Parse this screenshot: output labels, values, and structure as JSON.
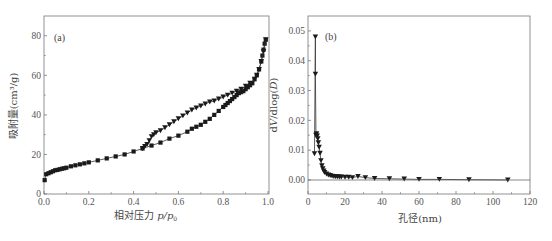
{
  "chart_data": [
    {
      "type": "scatter",
      "panel_label": "(a)",
      "title": "",
      "xlabel": "相对压力 p/p0",
      "xlabel_main": "相对压力 ",
      "xlabel_var": "p/p",
      "xlabel_sub": "0",
      "ylabel": "吸附量(cm³/g)",
      "xlim": [
        0.0,
        1.0
      ],
      "ylim": [
        0,
        90
      ],
      "xticks": [
        "0.0",
        "0.2",
        "0.4",
        "0.6",
        "0.8",
        "1.0"
      ],
      "yticks": [
        "0",
        "20",
        "40",
        "60",
        "80"
      ],
      "grid": false,
      "legend": "none",
      "series": [
        {
          "name": "adsorption",
          "marker": "square",
          "x": [
            0.003,
            0.01,
            0.02,
            0.03,
            0.04,
            0.05,
            0.06,
            0.07,
            0.08,
            0.09,
            0.1,
            0.12,
            0.14,
            0.16,
            0.18,
            0.2,
            0.24,
            0.28,
            0.32,
            0.36,
            0.4,
            0.44,
            0.48,
            0.52,
            0.56,
            0.6,
            0.64,
            0.66,
            0.68,
            0.7,
            0.72,
            0.74,
            0.76,
            0.78,
            0.8,
            0.81,
            0.82,
            0.83,
            0.84,
            0.85,
            0.86,
            0.87,
            0.88,
            0.89,
            0.9,
            0.91,
            0.92,
            0.93,
            0.94,
            0.95,
            0.96,
            0.97,
            0.975,
            0.98,
            0.985,
            0.99
          ],
          "y": [
            7,
            10,
            10.5,
            11,
            11.5,
            12,
            12.2,
            12.5,
            12.8,
            13,
            13.3,
            14,
            14.5,
            15,
            15.5,
            16,
            17,
            18,
            19,
            20,
            21.5,
            23,
            24.5,
            26,
            28,
            29.5,
            31.5,
            33,
            34,
            35,
            36.5,
            38,
            40,
            42,
            44,
            45,
            46,
            47,
            48,
            49,
            50,
            51,
            51.5,
            52,
            53,
            54,
            55,
            56,
            58,
            60,
            63,
            67,
            70,
            73,
            76,
            78
          ]
        },
        {
          "name": "desorption",
          "marker": "triangle-down",
          "x": [
            0.44,
            0.45,
            0.46,
            0.47,
            0.48,
            0.49,
            0.5,
            0.52,
            0.54,
            0.56,
            0.58,
            0.6,
            0.62,
            0.64,
            0.66,
            0.68,
            0.7,
            0.72,
            0.74,
            0.76,
            0.78,
            0.8,
            0.82,
            0.84,
            0.86,
            0.88,
            0.9,
            0.92,
            0.94,
            0.95,
            0.96,
            0.97,
            0.98,
            0.99
          ],
          "y": [
            23,
            24,
            25,
            27,
            29,
            30,
            31,
            32,
            33.5,
            35,
            36.5,
            38,
            39.5,
            41,
            42.5,
            43.5,
            44.5,
            45.5,
            46.5,
            47,
            48,
            49,
            50,
            51,
            52,
            53,
            54.5,
            56,
            58,
            60,
            63,
            67,
            72,
            78
          ]
        }
      ]
    },
    {
      "type": "line",
      "panel_label": "(b)",
      "title": "",
      "xlabel": "孔径(nm)",
      "ylabel": "dV/dlog(D)",
      "ylabel_parts": [
        "d",
        "V",
        "/dlog(",
        "D",
        ")"
      ],
      "xlim": [
        0,
        120
      ],
      "ylim": [
        -0.0047,
        0.055
      ],
      "xticks": [
        "0",
        "20",
        "40",
        "60",
        "80",
        "100",
        "120"
      ],
      "yticks": [
        "0.00",
        "0.01",
        "0.02",
        "0.03",
        "0.04",
        "0.05"
      ],
      "grid": false,
      "legend": "none",
      "series": [
        {
          "name": "pore size distribution",
          "marker": "triangle-down",
          "x": [
            3.5,
            4.0,
            4.0,
            4.3,
            4.6,
            5.0,
            5.3,
            5.6,
            6.0,
            6.5,
            7.0,
            7.5,
            8.0,
            8.5,
            9.0,
            10,
            11,
            12,
            13,
            14,
            15,
            16,
            17,
            18,
            20,
            22,
            24,
            27,
            31,
            36,
            44,
            52,
            60,
            71,
            87,
            108
          ],
          "y": [
            0.0088,
            0.048,
            0.0355,
            0.015,
            0.0155,
            0.0148,
            0.0138,
            0.0125,
            0.011,
            0.009,
            0.0065,
            0.0048,
            0.0038,
            0.003,
            0.0025,
            0.002,
            0.0017,
            0.0015,
            0.0013,
            0.0012,
            0.0011,
            0.0011,
            0.001,
            0.001,
            0.0009,
            0.0009,
            0.0008,
            0.0012,
            0.0008,
            0.0005,
            0.0004,
            0.0003,
            0.0002,
            0.0002,
            0.0001,
            0.0
          ]
        }
      ]
    }
  ]
}
